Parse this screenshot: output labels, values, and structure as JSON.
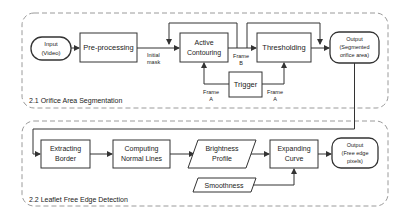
{
  "sections": [
    {
      "id": "orifice",
      "label": "2.1 Orifice Area Segmentation"
    },
    {
      "id": "leaflet",
      "label": "2.2 Leaflet Free Edge Detection"
    }
  ],
  "nodes": {
    "input": {
      "line1": "Input",
      "line2": "(Video)"
    },
    "preprocessing": {
      "label": "Pre-processing"
    },
    "active_contouring": {
      "line1": "Active",
      "line2": "Contouring"
    },
    "thresholding": {
      "label": "Thresholding"
    },
    "trigger": {
      "label": "Trigger"
    },
    "output_segmented": {
      "line1": "Output",
      "line2": "(Segmented",
      "line3": "orifice area)"
    },
    "extracting_border": {
      "line1": "Extracting",
      "line2": "Border"
    },
    "computing_normals": {
      "line1": "Computing",
      "line2": "Normal Lines"
    },
    "brightness_profile": {
      "line1": "Brightness",
      "line2": "Profile"
    },
    "expanding_curve": {
      "line1": "Expanding",
      "line2": "Curve"
    },
    "smoothness": {
      "label": "Smoothness"
    },
    "output_free_edge": {
      "line1": "Output",
      "line2": "(Free edge",
      "line3": "pixels)"
    }
  },
  "edge_labels": {
    "initial_mask": {
      "line1": "Initial",
      "line2": "mask"
    },
    "frame_b": {
      "line1": "Frame",
      "line2": "B"
    },
    "frame_a_left": {
      "line1": "Frame",
      "line2": "A"
    },
    "frame_a_right": {
      "line1": "Frame",
      "line2": "A"
    }
  },
  "colors": {
    "stroke": "#333333",
    "dash": "#999999",
    "text": "#222222"
  }
}
